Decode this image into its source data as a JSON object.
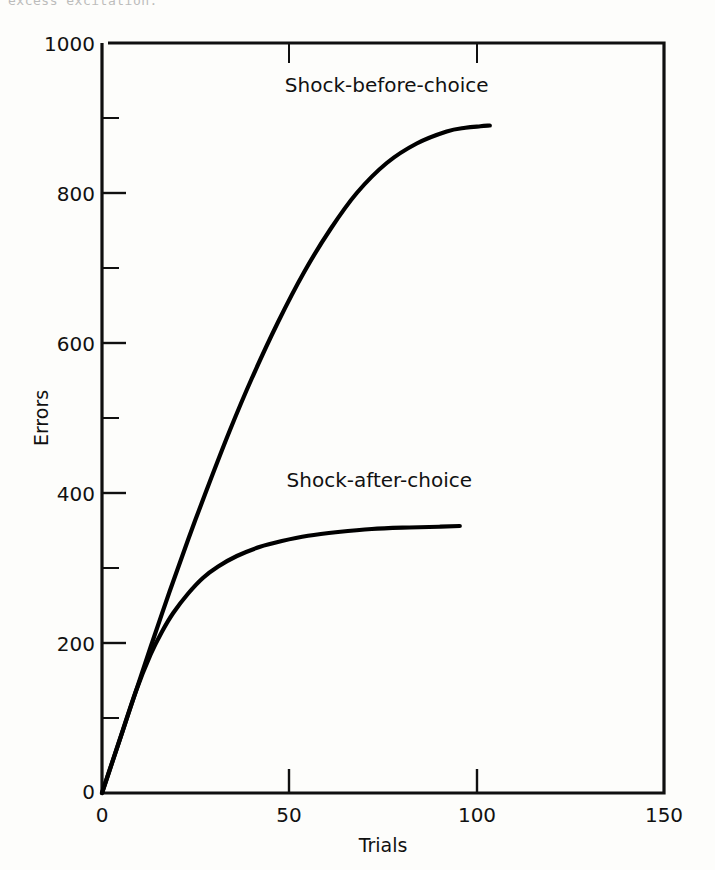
{
  "page": {
    "background_color": "#fdfdfb",
    "ink_color": "#000000",
    "top_cut_text": "excess excitation."
  },
  "chart_data": {
    "type": "line",
    "title": "",
    "subtitle": "",
    "xlabel": "Trials",
    "ylabel": "Errors",
    "xlim": [
      0,
      150
    ],
    "ylim": [
      0,
      1000
    ],
    "grid": false,
    "legend_position": "inline-annotation",
    "x_ticks": [
      0,
      50,
      100,
      150
    ],
    "x_tick_labels": [
      "0",
      "50",
      "100",
      "150"
    ],
    "x_minor_ticks": [
      25,
      75,
      125
    ],
    "y_ticks": [
      0,
      200,
      400,
      600,
      800,
      1000
    ],
    "y_tick_labels": [
      "0",
      "200",
      "400",
      "600",
      "800",
      "1000"
    ],
    "y_minor_ticks": [
      100,
      300,
      500,
      700,
      900
    ],
    "series": [
      {
        "name": "Shock-before-choice",
        "label": "Shock-before-choice",
        "label_x": 76,
        "label_y": 935,
        "color": "#000000",
        "x": [
          0,
          2,
          5,
          9,
          13,
          18,
          23,
          28,
          34,
          40,
          47,
          54,
          61,
          68,
          76,
          84,
          92,
          97,
          101,
          103.5
        ],
        "y": [
          0,
          30,
          75,
          135,
          195,
          268,
          338,
          405,
          482,
          553,
          628,
          695,
          752,
          800,
          840,
          866,
          882,
          887,
          889,
          890
        ]
      },
      {
        "name": "Shock-after-choice",
        "label": "Shock-after-choice",
        "label_x": 74,
        "label_y": 408,
        "color": "#000000",
        "x": [
          0,
          2,
          5,
          9,
          13,
          16,
          19,
          23,
          27,
          31,
          36,
          42,
          48,
          55,
          63,
          72,
          82,
          90,
          95.5
        ],
        "y": [
          0,
          30,
          75,
          135,
          185,
          215,
          240,
          266,
          287,
          302,
          316,
          328,
          336,
          343,
          348,
          352,
          354,
          355,
          356
        ]
      }
    ]
  }
}
